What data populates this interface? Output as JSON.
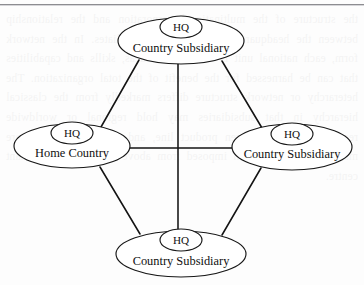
{
  "page": {
    "background_color": "#fdfdfd",
    "rule_color": "#8d8d91",
    "showthrough_text": "the structure of the multinational corporation and the relationship between the headquarters and its foreign affiliates. In the network form, each national unit is a source of ideas, skills and capabilities that can be harnessed for the benefit of the total organization. The heterarchy or network structure differs markedly from the classical hierarchy in that subsidiaries may hold regional or worldwide responsibility for a given product line, and strategic decisions are made jointly rather than imposed from above by a single dominant centre."
  },
  "diagram": {
    "line_color": "#141414",
    "node_fill": "#ffffff",
    "node_stroke": "#171717",
    "nodes": [
      {
        "id": "top",
        "hq_label": "HQ",
        "label": "Country Subsidiary",
        "cx": 181,
        "cy": 41,
        "rx": 63,
        "ry": 23,
        "hq_cx": 181,
        "hq_cy": 27,
        "hq_rx": 21,
        "hq_ry": 11,
        "label_x": 181,
        "label_y": 52
      },
      {
        "id": "left",
        "hq_label": "HQ",
        "label": "Home Country",
        "cx": 72,
        "cy": 146,
        "rx": 58,
        "ry": 22,
        "hq_cx": 72,
        "hq_cy": 133,
        "hq_rx": 21,
        "hq_ry": 11,
        "label_x": 72,
        "label_y": 157
      },
      {
        "id": "right",
        "hq_label": "HQ",
        "label": "Country Subsidiary",
        "cx": 292,
        "cy": 147,
        "rx": 60,
        "ry": 23,
        "hq_cx": 292,
        "hq_cy": 134,
        "hq_rx": 21,
        "hq_ry": 11,
        "label_x": 292,
        "label_y": 158
      },
      {
        "id": "bottom",
        "hq_label": "HQ",
        "label": "Country Subsidiary",
        "cx": 181,
        "cy": 254,
        "rx": 65,
        "ry": 23,
        "hq_cx": 181,
        "hq_cy": 240,
        "hq_rx": 21,
        "hq_ry": 11,
        "label_x": 181,
        "label_y": 265
      }
    ],
    "edges": [
      {
        "id": "vertical-top-bottom",
        "x1": 178,
        "y1": 64,
        "x2": 178,
        "y2": 231
      },
      {
        "id": "horizontal-left-right",
        "x1": 130,
        "y1": 148,
        "x2": 232,
        "y2": 148
      },
      {
        "id": "diagonal-top-left",
        "x1": 139,
        "y1": 60,
        "x2": 101,
        "y2": 127
      },
      {
        "id": "diagonal-top-right",
        "x1": 222,
        "y1": 61,
        "x2": 262,
        "y2": 128
      },
      {
        "id": "diagonal-left-bottom",
        "x1": 100,
        "y1": 167,
        "x2": 140,
        "y2": 234
      },
      {
        "id": "diagonal-right-bottom",
        "x1": 261,
        "y1": 168,
        "x2": 222,
        "y2": 235
      }
    ]
  }
}
